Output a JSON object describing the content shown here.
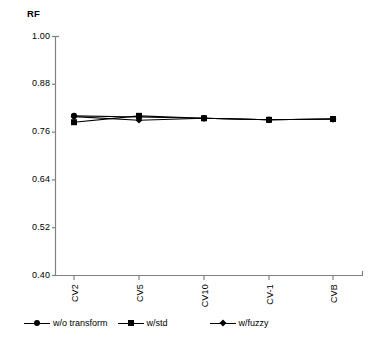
{
  "chart_data": {
    "type": "line",
    "title": "",
    "ylabel": "RF",
    "xlabel": "",
    "categories": [
      "CV2",
      "CV5",
      "CV10",
      "CV-1",
      "CVB"
    ],
    "ylim": [
      0.4,
      1.0
    ],
    "yticks": [
      "1.00",
      "0.88",
      "0.76",
      "0.64",
      "0.52",
      "0.40"
    ],
    "ytick_values": [
      1.0,
      0.88,
      0.76,
      0.64,
      0.52,
      0.4
    ],
    "grid": false,
    "legend_position": "bottom",
    "series": [
      {
        "name": "w/o transform",
        "marker": "circle",
        "values": [
          0.8,
          0.797,
          0.794,
          0.79,
          0.792
        ]
      },
      {
        "name": "w/std",
        "marker": "square",
        "values": [
          0.784,
          0.8,
          0.794,
          0.79,
          0.792
        ]
      },
      {
        "name": "w/fuzzy",
        "marker": "diamond",
        "values": [
          0.798,
          0.789,
          0.794,
          0.79,
          0.792
        ]
      }
    ]
  },
  "axis": {
    "y_label": "RF"
  },
  "legend": {
    "items": [
      {
        "label": "w/o transform",
        "marker": "circle-marker-icon"
      },
      {
        "label": "w/std",
        "marker": "square-marker-icon"
      },
      {
        "label": "w/fuzzy",
        "marker": "diamond-marker-icon"
      }
    ]
  },
  "colors": {
    "axis": "#808080",
    "series": "#000000",
    "background": "#ffffff"
  }
}
